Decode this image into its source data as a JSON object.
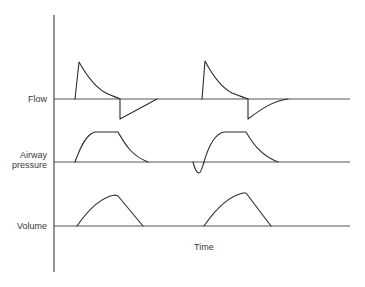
{
  "figure": {
    "type": "ventilator-waveform-diagram",
    "labels": {
      "flow": "Flow",
      "pressure_line1": "Airway",
      "pressure_line2": "pressure",
      "volume": "Volume",
      "time": "Time"
    },
    "colors": {
      "background": "#ffffff",
      "trace": "#2b2b2b",
      "axis": "#4a4a4a",
      "text": "#3a3a3a"
    },
    "traces": [
      {
        "name": "Flow",
        "baseline_y": 99,
        "cycles": [
          {
            "inspiration_start_x": 75,
            "peak_x": 79,
            "peak_y": 62,
            "inspiration_end_x": 120,
            "expiratory_trough_y": 119,
            "expiration_end_x": 157
          },
          {
            "inspiration_start_x": 202,
            "peak_x": 205,
            "peak_y": 61,
            "inspiration_end_x": 248,
            "expiratory_trough_y": 119,
            "expiration_end_x": 288
          }
        ]
      },
      {
        "name": "Airway pressure",
        "baseline_y": 162,
        "cycles": [
          {
            "rise_start_x": 75,
            "plateau_start_x": 93,
            "plateau_end_x": 118,
            "plateau_y": 132,
            "fall_end_x": 148,
            "negative_deflection": false
          },
          {
            "rise_start_x": 203,
            "plateau_start_x": 222,
            "plateau_end_x": 246,
            "plateau_y": 132,
            "fall_end_x": 278,
            "negative_deflection": true,
            "deflection_bottom_x": 198,
            "deflection_bottom_y": 173
          }
        ]
      },
      {
        "name": "Volume",
        "baseline_y": 226,
        "cycles": [
          {
            "rise_start_x": 77,
            "peak_x": 118,
            "peak_y": 196,
            "fall_end_x": 143
          },
          {
            "rise_start_x": 204,
            "peak_x": 246,
            "peak_y": 193,
            "fall_end_x": 271
          }
        ]
      }
    ],
    "axis": {
      "x": 54,
      "top_y": 15,
      "bottom_y": 272,
      "baseline_end_x": 350
    }
  }
}
